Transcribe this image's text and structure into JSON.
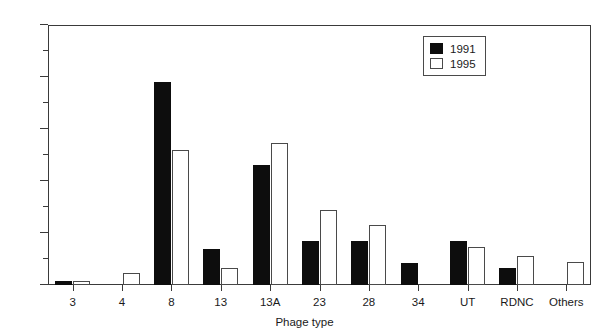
{
  "chart_data": {
    "type": "bar",
    "title": "",
    "xlabel": "Phage type",
    "ylabel": "",
    "categories": [
      "3",
      "4",
      "8",
      "13",
      "13A",
      "23",
      "28",
      "34",
      "UT",
      "RDNC",
      "Others"
    ],
    "series": [
      {
        "name": "1991",
        "color": "#0d0d0d",
        "values": [
          0.8,
          0,
          39,
          7,
          23,
          8.5,
          8.5,
          4.3,
          8.5,
          3.3,
          0
        ]
      },
      {
        "name": "1995",
        "color": "#ffffff",
        "values": [
          0.7,
          2.3,
          26,
          3.2,
          27.3,
          14.5,
          11.5,
          0,
          7.3,
          5.5,
          4.5
        ]
      }
    ],
    "ylim": [
      0,
      50
    ],
    "y_major_ticks": [
      0,
      10,
      20,
      30,
      40,
      50
    ],
    "y_minor_ticks": [
      5,
      15,
      25,
      35,
      45
    ],
    "y_tick_labels": [
      "0",
      "10",
      "20",
      "30",
      "40",
      "50"
    ],
    "grid": false,
    "legend_position": "top-right"
  },
  "legend": {
    "entries": [
      {
        "label": "1991"
      },
      {
        "label": "1995"
      }
    ]
  },
  "axis": {
    "x_title": "Phage type"
  }
}
